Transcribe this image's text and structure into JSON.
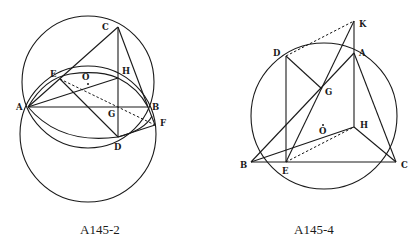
{
  "figures": [
    {
      "caption": "A145-2",
      "points": {
        "A": {
          "label": "A",
          "x": 28,
          "y": 107
        },
        "B": {
          "label": "B",
          "x": 148,
          "y": 107
        },
        "C": {
          "label": "C",
          "x": 118,
          "y": 27
        },
        "D": {
          "label": "D",
          "x": 118,
          "y": 137
        },
        "E": {
          "label": "E",
          "x": 60,
          "y": 79
        },
        "F": {
          "label": "F",
          "x": 155,
          "y": 125
        },
        "G": {
          "label": "G",
          "x": 118,
          "y": 107
        },
        "H": {
          "label": "H",
          "x": 118,
          "y": 78
        },
        "O": {
          "label": "O",
          "x": 88,
          "y": 81
        }
      },
      "circles": [
        {
          "name": "upper-circle",
          "cx": 88,
          "cy": 82,
          "r": 66
        },
        {
          "name": "lower-circle",
          "cx": 88,
          "cy": 134,
          "r": 68
        }
      ],
      "arc": {
        "name": "arc-AHB",
        "from": "A",
        "to": "B",
        "through": "H"
      },
      "segments": [
        "A-B",
        "A-C",
        "C-B",
        "C-D",
        "A-E",
        "E-D",
        "A-H",
        "D-F",
        "B-F"
      ],
      "dashed": [
        "E-F"
      ]
    },
    {
      "caption": "A145-4",
      "points": {
        "A": {
          "label": "A",
          "x": 354,
          "y": 53
        },
        "B": {
          "label": "B",
          "x": 251,
          "y": 162
        },
        "C": {
          "label": "C",
          "x": 396,
          "y": 162
        },
        "D": {
          "label": "D",
          "x": 286,
          "y": 56
        },
        "E": {
          "label": "E",
          "x": 286,
          "y": 162
        },
        "G": {
          "label": "G",
          "x": 322,
          "y": 89
        },
        "H": {
          "label": "H",
          "x": 354,
          "y": 127
        },
        "K": {
          "label": "K",
          "x": 354,
          "y": 21
        },
        "O": {
          "label": "O",
          "x": 324,
          "y": 124
        }
      },
      "circles": [
        {
          "name": "circumcircle",
          "cx": 324,
          "cy": 116,
          "r": 73
        }
      ],
      "segments": [
        "B-C",
        "A-B",
        "A-C",
        "K-H",
        "H-B",
        "H-C",
        "D-E",
        "D-G",
        "E-K"
      ],
      "dashed": [
        "D-K",
        "E-H"
      ]
    }
  ]
}
